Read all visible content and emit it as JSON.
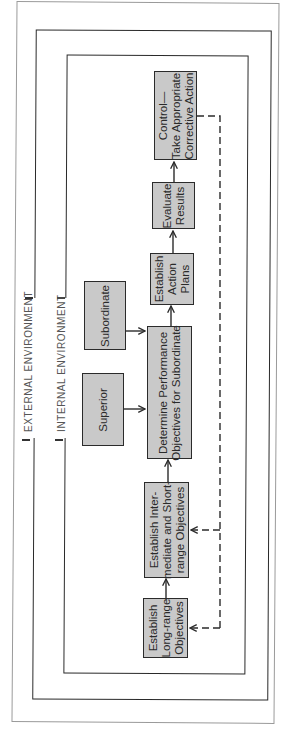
{
  "diagram": {
    "orientation": "rotated-90-ccw",
    "colors": {
      "box_fill": "#c9c9c9",
      "box_border": "#2b2b2b",
      "line": "#2b2b2b",
      "label_text": "#555555",
      "background": "#ffffff"
    },
    "environments": {
      "external": {
        "label": "EXTERNAL ENVIRONMENT"
      },
      "internal": {
        "label": "INTERNAL ENVIRONMENT"
      }
    },
    "nodes": {
      "long_range": {
        "label": "Establish\nLong-range\nObjectives"
      },
      "intermediate": {
        "label": "Establish Inter-\nmediate and Short-\nrange Objectives"
      },
      "determine": {
        "label": "Determine Performance\nObjectives for Subordinate"
      },
      "superior": {
        "label": "Superior"
      },
      "subordinate": {
        "label": "Subordinate"
      },
      "action_plans": {
        "label": "Establish\nAction\nPlans"
      },
      "evaluate": {
        "label": "Evaluate\nResults"
      },
      "control": {
        "label": "Control—\nTake Appropriate\nCorrective Action"
      }
    },
    "edges": [
      {
        "from": "long_range",
        "to": "intermediate",
        "style": "solid"
      },
      {
        "from": "intermediate",
        "to": "determine",
        "style": "solid"
      },
      {
        "from": "superior",
        "to": "determine",
        "style": "solid"
      },
      {
        "from": "subordinate",
        "to": "determine",
        "style": "solid"
      },
      {
        "from": "determine",
        "to": "action_plans",
        "style": "solid"
      },
      {
        "from": "action_plans",
        "to": "evaluate",
        "style": "solid"
      },
      {
        "from": "evaluate",
        "to": "control",
        "style": "solid"
      },
      {
        "from": "control",
        "to": "intermediate",
        "style": "dashed"
      },
      {
        "from": "control",
        "to": "long_range",
        "style": "dashed"
      }
    ]
  }
}
